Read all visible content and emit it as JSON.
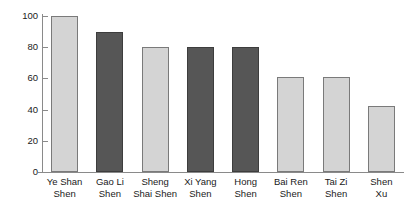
{
  "chart_data": {
    "type": "bar",
    "title": "",
    "xlabel": "",
    "ylabel": "",
    "ylim": [
      0,
      100
    ],
    "yticks": [
      0,
      20,
      40,
      60,
      80,
      100
    ],
    "grid": false,
    "legend": "none",
    "categories": [
      "Ye Shan Shen",
      "Gao Li Shen",
      "Sheng Shai Shen",
      "Xi Yang Shen",
      "Hong Shen",
      "Bai Ren Shen",
      "Tai Zi Shen",
      "Shen Xu"
    ],
    "category_lines": [
      [
        "Ye Shan",
        "Shen"
      ],
      [
        "Gao Li",
        "Shen"
      ],
      [
        "Sheng",
        "Shai Shen"
      ],
      [
        "Xi Yang",
        "Shen"
      ],
      [
        "Hong",
        "Shen"
      ],
      [
        "Bai Ren",
        "Shen"
      ],
      [
        "Tai Zi",
        "Shen"
      ],
      [
        "Shen",
        "Xu"
      ]
    ],
    "values": [
      100,
      90,
      80,
      80,
      80,
      61,
      61,
      42
    ],
    "bar_shades": [
      "light",
      "dark",
      "light",
      "dark",
      "dark",
      "light",
      "light",
      "light"
    ],
    "colors": {
      "light_fill": "#d4d4d4",
      "light_border": "#7a7a7a",
      "dark_fill": "#565656",
      "dark_border": "#3d3d3d",
      "axis": "#8a8a8a",
      "text": "#1a1a1a",
      "background": "#ffffff"
    }
  }
}
